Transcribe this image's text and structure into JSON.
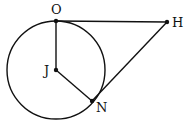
{
  "diagram": {
    "type": "geometry",
    "stroke_color": "#111111",
    "circle": {
      "center": "J",
      "cx": 56,
      "cy": 70,
      "r": 49
    },
    "points": {
      "O": {
        "label": "O",
        "x": 56,
        "y": 21
      },
      "H": {
        "label": "H",
        "x": 167,
        "y": 22
      },
      "J": {
        "label": "J",
        "x": 56,
        "y": 70
      },
      "N": {
        "label": "N",
        "x": 92,
        "y": 101
      }
    },
    "segments": [
      {
        "from": "O",
        "to": "H"
      },
      {
        "from": "O",
        "to": "J"
      },
      {
        "from": "J",
        "to": "N"
      },
      {
        "from": "N",
        "to": "H"
      }
    ]
  }
}
